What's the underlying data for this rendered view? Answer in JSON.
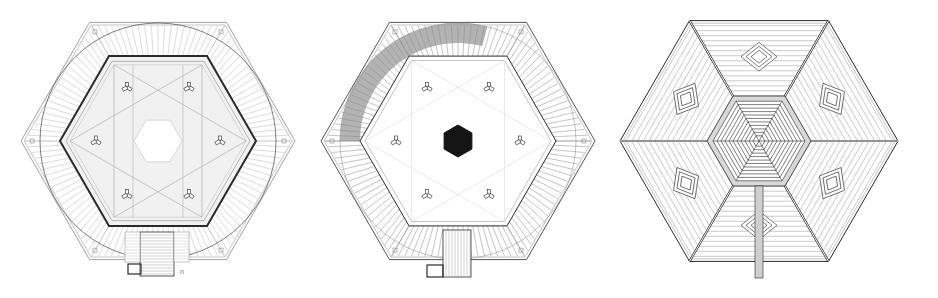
{
  "figure": {
    "colors": {
      "ink": "#2a2a2a",
      "line": "#8a8a8a",
      "light_line": "#b9b9b9",
      "floor_fill": "#f1f1f1",
      "shaded": "#9a9a9a",
      "core": "#151515",
      "paper": "#ffffff"
    },
    "plans": [
      {
        "id": "plan-1",
        "title": "Ground floor plan",
        "features": [
          "outer hexagon terrace",
          "radial stepped seating ring",
          "inner hexagonal hall",
          "six Y-shaped columns",
          "star ceiling grid",
          "entrance stair"
        ],
        "column_count": 6,
        "mark": "n"
      },
      {
        "id": "plan-2",
        "title": "Upper floor plan",
        "features": [
          "outer hexagon",
          "radial seating ring",
          "shaded seating section (upper-left)",
          "six Y-shaped columns",
          "solid black hexagonal core",
          "entrance stair"
        ],
        "column_count": 6
      },
      {
        "id": "plan-3",
        "title": "Roof plan",
        "features": [
          "hexagon roof",
          "six radial ridges",
          "concentric central lantern",
          "six diamond skylights",
          "entrance walkway"
        ],
        "skylight_count": 6
      }
    ]
  }
}
